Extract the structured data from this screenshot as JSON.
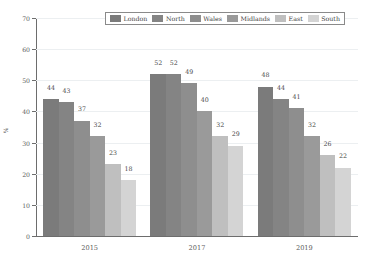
{
  "chart_data": {
    "type": "bar",
    "title": "",
    "subtitle": "",
    "xlabel": "",
    "ylabel": "%",
    "categories": [
      "2015",
      "2017",
      "2019"
    ],
    "ylim": [
      0,
      70
    ],
    "yticks": [
      0,
      10,
      20,
      30,
      40,
      50,
      60,
      70
    ],
    "grid": true,
    "legend_position": "top-center",
    "series": [
      {
        "name": "London",
        "color": "#7b7b7b",
        "values": [
          44,
          52,
          48
        ]
      },
      {
        "name": "North",
        "color": "#848484",
        "values": [
          43,
          52,
          44
        ]
      },
      {
        "name": "Wales",
        "color": "#8e8e8e",
        "values": [
          37,
          49,
          41
        ]
      },
      {
        "name": "Midlands",
        "color": "#9a9a9a",
        "values": [
          32,
          40,
          32
        ]
      },
      {
        "name": "East",
        "color": "#bfbfbf",
        "values": [
          23,
          32,
          26
        ]
      },
      {
        "name": "South",
        "color": "#d4d4d4",
        "values": [
          18,
          29,
          22
        ]
      }
    ]
  }
}
